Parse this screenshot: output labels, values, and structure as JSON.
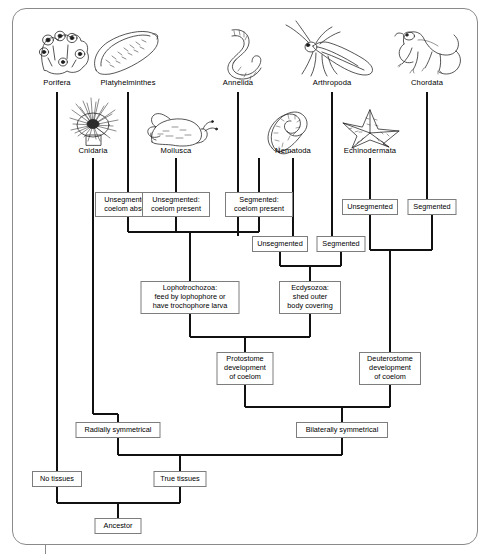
{
  "diagram": {
    "frame_color": "#8a8a8a",
    "line_color": "#111111",
    "box_border_color": "#7d7d7d",
    "background": "#ffffff"
  },
  "taxa_top": [
    {
      "name": "Porifera",
      "icon": "sponge-icon",
      "x": 57
    },
    {
      "name": "Platyhelminthes",
      "icon": "flatworm-icon",
      "x": 128
    },
    {
      "name": "Annelida",
      "icon": "earthworm-icon",
      "x": 238
    },
    {
      "name": "Arthropoda",
      "icon": "insect-icon",
      "x": 332
    },
    {
      "name": "Chordata",
      "icon": "lizard-icon",
      "x": 427
    }
  ],
  "taxa_second": [
    {
      "name": "Cnidaria",
      "icon": "sea-anemone-icon",
      "x": 93
    },
    {
      "name": "Mollusca",
      "icon": "snail-icon",
      "x": 176
    },
    {
      "name": "Nematoda",
      "icon": "roundworm-icon",
      "x": 293
    },
    {
      "name": "Echinodermata",
      "icon": "sea-star-icon",
      "x": 370
    }
  ],
  "trait_boxes": [
    {
      "id": "unseg-coelom-absent",
      "lines": [
        "Unsegmented:",
        "coelom absent"
      ],
      "x": 128,
      "y": 192,
      "w": 66,
      "h": 25
    },
    {
      "id": "unseg-coelom-present",
      "lines": [
        "Unsegmented:",
        "coelom present"
      ],
      "x": 176,
      "y": 192,
      "w": 68,
      "h": 25
    },
    {
      "id": "seg-coelom-present",
      "lines": [
        "Segmented:",
        "coelom present"
      ],
      "x": 259,
      "y": 192,
      "w": 68,
      "h": 25
    },
    {
      "id": "unsegmented-ecdy",
      "lines": [
        "Unsegmented"
      ],
      "x": 280,
      "y": 236,
      "w": 56,
      "h": 16
    },
    {
      "id": "segmented-ecdy",
      "lines": [
        "Segmented"
      ],
      "x": 341,
      "y": 236,
      "w": 49,
      "h": 16
    },
    {
      "id": "unsegmented-deut",
      "lines": [
        "Unsegmented"
      ],
      "x": 370,
      "y": 199,
      "w": 56,
      "h": 16
    },
    {
      "id": "segmented-deut",
      "lines": [
        "Segmented"
      ],
      "x": 432,
      "y": 199,
      "w": 49,
      "h": 16
    },
    {
      "id": "lophotrochozoa",
      "lines": [
        "Lophotrochozoa:",
        "feed by lophophore or",
        "have trochophore larva"
      ],
      "x": 190,
      "y": 281,
      "w": 99,
      "h": 33
    },
    {
      "id": "ecdysozoa",
      "lines": [
        "Ecdysozoa:",
        "shed outer",
        "body covering"
      ],
      "x": 310,
      "y": 281,
      "w": 62,
      "h": 33
    },
    {
      "id": "protostome",
      "lines": [
        "Protostome",
        "development",
        "of coelom"
      ],
      "x": 245,
      "y": 352,
      "w": 57,
      "h": 33
    },
    {
      "id": "deuterostome",
      "lines": [
        "Deuterostome",
        "development",
        "of coelom"
      ],
      "x": 390,
      "y": 352,
      "w": 62,
      "h": 33
    },
    {
      "id": "radially-symmetrical",
      "lines": [
        "Radially symmetrical"
      ],
      "x": 118,
      "y": 422,
      "w": 85,
      "h": 16
    },
    {
      "id": "bilaterally-symmetrical",
      "lines": [
        "Bilaterally symmetrical"
      ],
      "x": 342,
      "y": 422,
      "w": 92,
      "h": 16
    },
    {
      "id": "no-tissues",
      "lines": [
        "No tissues"
      ],
      "x": 57,
      "y": 471,
      "w": 50,
      "h": 16
    },
    {
      "id": "true-tissues",
      "lines": [
        "True tissues"
      ],
      "x": 180,
      "y": 471,
      "w": 53,
      "h": 16
    },
    {
      "id": "ancestor",
      "lines": [
        "Ancestor"
      ],
      "x": 118,
      "y": 518,
      "w": 47,
      "h": 16
    }
  ]
}
